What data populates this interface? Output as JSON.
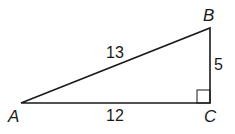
{
  "diagram": {
    "type": "right-triangle",
    "vertices": {
      "A": {
        "label": "A",
        "x": 21,
        "y": 103
      },
      "B": {
        "label": "B",
        "x": 210,
        "y": 28
      },
      "C": {
        "label": "C",
        "x": 210,
        "y": 103
      }
    },
    "sides": {
      "AB": {
        "label": "13"
      },
      "AC": {
        "label": "12"
      },
      "BC": {
        "label": "5"
      }
    },
    "right_angle_at": "C",
    "stroke_color": "#1a1a1a"
  }
}
